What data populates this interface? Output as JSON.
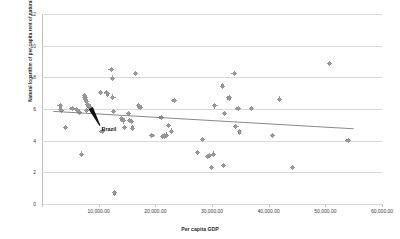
{
  "chart_data": {
    "type": "scatter",
    "title": "",
    "xlabel": "Per capita GDP",
    "ylabel": "Natural logarithm of per capita rent of natural resources",
    "xlim": [
      0,
      60000
    ],
    "ylim": [
      0,
      12
    ],
    "grid": true,
    "legend": "none",
    "xticks": [
      0,
      10000,
      20000,
      30000,
      40000,
      50000,
      60000
    ],
    "xtick_labels": [
      "",
      "10,000.00",
      "20,000.00",
      "30,000.00",
      "40,000.00",
      "50,000.00",
      "60,000.00"
    ],
    "yticks": [
      0,
      2,
      4,
      6,
      8,
      10,
      12
    ],
    "ytick_labels": [
      "0",
      "2",
      "4",
      "6",
      "8",
      "10",
      "12"
    ],
    "marker_color": "#8d8d8d",
    "line_color": "#6b6b6b",
    "grid_color": "#d9d9d9",
    "annotations": [
      {
        "text": "Brazil",
        "x": 10500,
        "y": 4.72,
        "point_x": 8600,
        "point_y": 6.05
      }
    ],
    "trendline": {
      "type": "linear",
      "x_start": 2000,
      "y_start": 5.85,
      "x_end": 55000,
      "y_end": 4.75
    },
    "points": [
      {
        "x": 3200,
        "y": 6.2
      },
      {
        "x": 3300,
        "y": 6.0
      },
      {
        "x": 3400,
        "y": 5.9
      },
      {
        "x": 4100,
        "y": 4.85
      },
      {
        "x": 5300,
        "y": 6.02
      },
      {
        "x": 6100,
        "y": 5.95
      },
      {
        "x": 6400,
        "y": 5.86
      },
      {
        "x": 6600,
        "y": 5.8
      },
      {
        "x": 7000,
        "y": 3.15
      },
      {
        "x": 7500,
        "y": 6.85
      },
      {
        "x": 7600,
        "y": 6.7
      },
      {
        "x": 7700,
        "y": 6.6
      },
      {
        "x": 7800,
        "y": 6.45
      },
      {
        "x": 7900,
        "y": 5.92
      },
      {
        "x": 8100,
        "y": 6.3
      },
      {
        "x": 8300,
        "y": 6.15
      },
      {
        "x": 8600,
        "y": 6.05
      },
      {
        "x": 10300,
        "y": 7.05
      },
      {
        "x": 10600,
        "y": 4.6
      },
      {
        "x": 11400,
        "y": 7.05
      },
      {
        "x": 11500,
        "y": 6.95
      },
      {
        "x": 12200,
        "y": 8.5
      },
      {
        "x": 12400,
        "y": 7.95
      },
      {
        "x": 12500,
        "y": 6.75
      },
      {
        "x": 12600,
        "y": 5.85
      },
      {
        "x": 12800,
        "y": 0.7
      },
      {
        "x": 14100,
        "y": 5.4
      },
      {
        "x": 14300,
        "y": 5.25
      },
      {
        "x": 14600,
        "y": 4.85
      },
      {
        "x": 15300,
        "y": 5.7
      },
      {
        "x": 15500,
        "y": 5.28
      },
      {
        "x": 15800,
        "y": 5.22
      },
      {
        "x": 16000,
        "y": 4.8
      },
      {
        "x": 16500,
        "y": 8.25
      },
      {
        "x": 17100,
        "y": 6.2
      },
      {
        "x": 17300,
        "y": 6.1
      },
      {
        "x": 19400,
        "y": 4.32
      },
      {
        "x": 21000,
        "y": 5.45
      },
      {
        "x": 21300,
        "y": 4.28
      },
      {
        "x": 21600,
        "y": 4.3
      },
      {
        "x": 21900,
        "y": 4.35
      },
      {
        "x": 22300,
        "y": 4.95
      },
      {
        "x": 22800,
        "y": 4.6
      },
      {
        "x": 23300,
        "y": 6.55
      },
      {
        "x": 27400,
        "y": 3.27
      },
      {
        "x": 28300,
        "y": 4.07
      },
      {
        "x": 29200,
        "y": 3.0
      },
      {
        "x": 29600,
        "y": 3.05
      },
      {
        "x": 29900,
        "y": 2.3
      },
      {
        "x": 30200,
        "y": 3.15
      },
      {
        "x": 30500,
        "y": 6.2
      },
      {
        "x": 31800,
        "y": 7.45
      },
      {
        "x": 32000,
        "y": 2.45
      },
      {
        "x": 32200,
        "y": 5.72
      },
      {
        "x": 33000,
        "y": 6.7
      },
      {
        "x": 33900,
        "y": 8.25
      },
      {
        "x": 34200,
        "y": 4.9
      },
      {
        "x": 34600,
        "y": 6.05
      },
      {
        "x": 34900,
        "y": 4.55
      },
      {
        "x": 37000,
        "y": 6.02
      },
      {
        "x": 40700,
        "y": 4.33
      },
      {
        "x": 41900,
        "y": 6.62
      },
      {
        "x": 44200,
        "y": 2.3
      },
      {
        "x": 50700,
        "y": 8.88
      },
      {
        "x": 54000,
        "y": 4.0
      }
    ]
  }
}
